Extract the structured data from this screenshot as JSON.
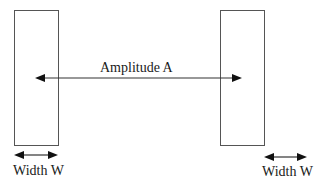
{
  "diagram": {
    "title": "",
    "pulses": [
      {
        "id": "left-pulse",
        "x": 14,
        "y": 10,
        "width": 44,
        "height": 135
      },
      {
        "id": "right-pulse",
        "x": 220,
        "y": 10,
        "width": 44,
        "height": 135
      }
    ],
    "amplitude": {
      "label": "Amplitude A",
      "x1": 35,
      "x2": 242,
      "y": 78
    },
    "width_markers": [
      {
        "label": "Width W",
        "arrow_x1": 14,
        "arrow_x2": 58,
        "arrow_y": 155,
        "label_x": 13,
        "label_y": 163
      },
      {
        "label": "Width W",
        "arrow_x1": 264,
        "arrow_x2": 307,
        "arrow_y": 157,
        "label_x": 262,
        "label_y": 164
      }
    ],
    "colors": {
      "stroke": "#555555",
      "arrow": "#1a1a1a",
      "text": "#1a1a1a",
      "background": "#ffffff"
    }
  }
}
